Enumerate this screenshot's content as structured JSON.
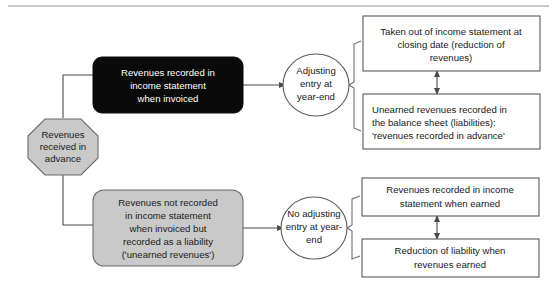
{
  "diagram": {
    "colors": {
      "gray_fill": "#c9c9c9",
      "black_fill": "#0a0a0a",
      "white_fill": "#ffffff",
      "stroke": "#5a5a5a",
      "connector": "#4a4a4a"
    },
    "start": {
      "shape": "octagon",
      "lines": [
        "Revenues",
        "received in",
        "advance"
      ]
    },
    "branch_top": {
      "shape": "rounded-rect-black",
      "lines": [
        "Revenues recorded in",
        "income statement",
        "when invoiced"
      ]
    },
    "branch_bottom": {
      "shape": "rounded-rect-gray",
      "lines": [
        "Revenues not recorded",
        "in income statement",
        "when invoiced but",
        "recorded as a liability",
        "('unearned revenues')"
      ]
    },
    "decision_top": {
      "shape": "ellipse",
      "lines": [
        "Adjusting",
        "entry at",
        "year-end"
      ]
    },
    "decision_bottom": {
      "shape": "ellipse",
      "lines": [
        "No adjusting",
        "entry at year-",
        "end"
      ]
    },
    "outcome_1": {
      "shape": "rect",
      "align": "center",
      "lines": [
        "Taken out of income statement at",
        "closing date (reduction of",
        "revenues)"
      ]
    },
    "outcome_2": {
      "shape": "rect",
      "align": "left",
      "lines": [
        "Unearned revenues recorded in",
        "the balance sheet (liabilities):",
        "'revenues recorded in advance'"
      ]
    },
    "outcome_3": {
      "shape": "rect",
      "align": "center",
      "lines": [
        "Revenues recorded in income",
        "statement when earned"
      ]
    },
    "outcome_4": {
      "shape": "rect",
      "align": "center",
      "lines": [
        "Reduction of liability when",
        "revenues earned"
      ]
    }
  }
}
